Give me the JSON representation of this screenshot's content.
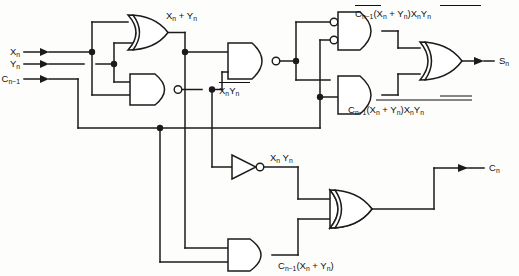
{
  "diagram": {
    "type": "logic-circuit-schematic",
    "ink_color": "#1b1b1b",
    "background_color": "#fdfdfc"
  },
  "inputs": [
    {
      "id": "x",
      "label": "X",
      "subscript": "n"
    },
    {
      "id": "y",
      "label": "Y",
      "subscript": "n"
    },
    {
      "id": "cin",
      "label": "C",
      "subscript": "n−1"
    }
  ],
  "outputs": [
    {
      "id": "sum",
      "label": "S",
      "subscript": "n"
    },
    {
      "id": "cout",
      "label": "C",
      "subscript": "n"
    }
  ],
  "labels": {
    "or_out": {
      "text": "X",
      "sub1": "n",
      "plus": "+",
      "text2": "Y",
      "sub2": "n"
    },
    "nand_out": {
      "text": "X",
      "sub1": "n",
      "text2": "Y",
      "sub2": "n",
      "overbar": true
    },
    "inv_out": {
      "text": "X",
      "sub1": "n",
      "text2": "Y",
      "sub2": "n",
      "overbar": false
    },
    "and_top": {
      "parts": "C̅n−1̅(Xn + Yn)X̅nY̅n",
      "c": "C",
      "c_sub": "n−1",
      "group": "(X",
      "g_sub1": "n",
      "g_plus": "+",
      "g_y": "Y",
      "g_sub2": "n",
      "g_close": ")",
      "xy": "X",
      "xy_sub1": "n",
      "xy_y": "Y",
      "xy_sub2": "n"
    },
    "and_bottom": {
      "c": "C",
      "c_sub": "n−1",
      "group": "(X",
      "g_sub1": "n",
      "g_plus": "+",
      "g_y": "Y",
      "g_sub2": "n",
      "g_close": ")",
      "xy": "X",
      "xy_sub1": "n",
      "xy_y": "Y",
      "xy_sub2": "n"
    },
    "and_carry": {
      "c": "C",
      "c_sub": "n−1",
      "group": "(X",
      "g_sub1": "n",
      "g_plus": "+",
      "g_y": "Y",
      "g_sub2": "n",
      "g_close": ")"
    }
  },
  "gates": [
    {
      "id": "or1",
      "type": "OR",
      "name": "or-gate-xy",
      "output_label": "X_n + Y_n"
    },
    {
      "id": "nand1",
      "type": "NAND",
      "name": "nand-gate-xy",
      "output_label": "not(X_n Y_n)"
    },
    {
      "id": "nand2",
      "type": "NAND",
      "name": "nand-gate-mid",
      "output_label": "not(X_n Y_n) combined"
    },
    {
      "id": "and_top",
      "type": "AND-inverted-inputs",
      "name": "and-gate-sum-top"
    },
    {
      "id": "and_bot",
      "type": "AND",
      "name": "and-gate-sum-bottom"
    },
    {
      "id": "or_sum",
      "type": "OR",
      "name": "or-gate-sum"
    },
    {
      "id": "inv",
      "type": "NOT",
      "name": "inverter-xy"
    },
    {
      "id": "and_carry",
      "type": "AND",
      "name": "and-gate-carry"
    },
    {
      "id": "or_carry",
      "type": "OR",
      "name": "or-gate-carry"
    }
  ]
}
